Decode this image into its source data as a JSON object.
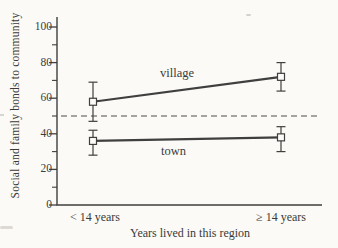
{
  "figure": {
    "background_color": "#fbfaf6",
    "ink_color": "#3f3f3f",
    "marker_fill_color": "#fcfbf8"
  },
  "chart_data": {
    "type": "line",
    "title": "",
    "xlabel": "Years lived in this region",
    "ylabel": "Social and family bonds to community",
    "categories": [
      "< 14 years",
      "≥ 14 years"
    ],
    "ylim": [
      0,
      100
    ],
    "y_major_ticks": [
      0,
      20,
      40,
      60,
      80,
      100
    ],
    "y_minor_ticks": [
      10,
      30,
      50,
      70,
      90
    ],
    "grid": false,
    "legend": "inline-series-labels",
    "marker": "open-square",
    "error_bars": true,
    "reference_line": {
      "y": 50,
      "style": "dashed"
    },
    "series": [
      {
        "name": "village",
        "values": [
          58,
          72
        ],
        "error_low": [
          47,
          64
        ],
        "error_high": [
          69,
          80
        ]
      },
      {
        "name": "town",
        "values": [
          36,
          38
        ],
        "error_low": [
          28,
          30
        ],
        "error_high": [
          42,
          44
        ]
      }
    ]
  }
}
